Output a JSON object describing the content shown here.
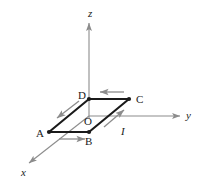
{
  "figure": {
    "background_color": "#ffffff",
    "axis_color": "#8c8c8c",
    "loop_color": "#1a1a1a",
    "arrow_color": "#8c8c8c",
    "label_color": "#1a1a1a",
    "axes": [
      {
        "name": "z",
        "label": "z",
        "label_x": 88,
        "label_y": 8,
        "direction": "up"
      },
      {
        "name": "y",
        "label": "y",
        "label_x": 186,
        "label_y": 110,
        "direction": "right"
      },
      {
        "name": "x",
        "label": "x",
        "label_x": 21,
        "label_y": 167,
        "direction": "down-left"
      }
    ],
    "vertices": [
      {
        "name": "O",
        "label": "O",
        "label_x": 84,
        "label_y": 116,
        "point_x": 89,
        "point_y": 116,
        "has_dot": false
      },
      {
        "name": "A",
        "label": "A",
        "label_x": 36,
        "label_y": 128,
        "point_x": 49,
        "point_y": 132,
        "has_dot": true
      },
      {
        "name": "B",
        "label": "B",
        "label_x": 85,
        "label_y": 136,
        "point_x": 89,
        "point_y": 132,
        "has_dot": true
      },
      {
        "name": "C",
        "label": "C",
        "label_x": 136,
        "label_y": 94,
        "point_x": 129,
        "point_y": 99,
        "has_dot": true
      },
      {
        "name": "D",
        "label": "D",
        "label_x": 78,
        "label_y": 90,
        "point_x": 89,
        "point_y": 99,
        "has_dot": true
      }
    ],
    "current": {
      "label": "I",
      "label_x": 121,
      "label_y": 126,
      "description": "Current direction arrows around loop A to B to C to D to A"
    },
    "loop_segments": [
      {
        "name": "segment-AB",
        "from": "A",
        "to": "B"
      },
      {
        "name": "segment-BC",
        "from": "B",
        "to": "C"
      },
      {
        "name": "segment-CD",
        "from": "C",
        "to": "D"
      },
      {
        "name": "segment-DA",
        "from": "D",
        "to": "A"
      }
    ],
    "current_arrows": [
      {
        "name": "current-arrow-ab",
        "along": "A-B",
        "points": "right"
      },
      {
        "name": "current-arrow-bc",
        "along": "B-C",
        "points": "up-right"
      },
      {
        "name": "current-arrow-cd",
        "along": "C-D",
        "points": "left"
      },
      {
        "name": "current-arrow-da",
        "along": "D-A",
        "points": "down-left"
      }
    ]
  }
}
